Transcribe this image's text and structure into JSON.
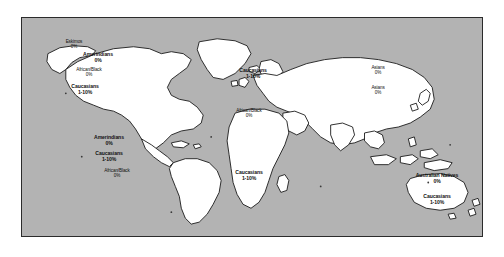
{
  "figure": {
    "type": "world-map",
    "background_color": "#ffffff",
    "ocean_color": "#b3b3b3",
    "land_color": "#ffffff",
    "outline_color": "#1a1a1a",
    "frame_color": "#2b2b2b",
    "text_color": "#111111"
  },
  "regions": [
    {
      "id": "north-america-eskimos",
      "group": "Eskimos",
      "value": "0%",
      "continent": "North America",
      "style": "small"
    },
    {
      "id": "north-america-amerindians",
      "group": "Amerindians",
      "value": "0%",
      "continent": "North America",
      "style": "bold"
    },
    {
      "id": "north-america-african-black",
      "group": "African/Black",
      "value": "0%",
      "continent": "North America",
      "style": "small"
    },
    {
      "id": "north-america-caucasians",
      "group": "Caucasians",
      "value": "1-10%",
      "continent": "North America",
      "style": "bold"
    },
    {
      "id": "south-america-amerindians",
      "group": "Amerindians",
      "value": "0%",
      "continent": "South America",
      "style": "bold"
    },
    {
      "id": "south-america-caucasians",
      "group": "Caucasians",
      "value": "1-10%",
      "continent": "South America",
      "style": "bold"
    },
    {
      "id": "south-america-african-black",
      "group": "African/Black",
      "value": "0%",
      "continent": "South America",
      "style": "small"
    },
    {
      "id": "europe-caucasians",
      "group": "Caucasians",
      "value": "1-10%",
      "continent": "Europe",
      "style": "bold"
    },
    {
      "id": "africa-african-black",
      "group": "African/Black",
      "value": "0%",
      "continent": "Africa",
      "style": "small"
    },
    {
      "id": "southern-africa-caucasians",
      "group": "Caucasians",
      "value": "1-10%",
      "continent": "Southern Africa",
      "style": "bold"
    },
    {
      "id": "asia-north-asians",
      "group": "Asians",
      "value": "0%",
      "continent": "Asia",
      "style": "small"
    },
    {
      "id": "asia-south-asians",
      "group": "Asians",
      "value": "0%",
      "continent": "Asia",
      "style": "small"
    },
    {
      "id": "australia-natives",
      "group": "Australian Natives",
      "value": "0%",
      "continent": "Australia",
      "style": "inline"
    },
    {
      "id": "australia-caucasians",
      "group": "Caucasians",
      "value": "1-10%",
      "continent": "Australia",
      "style": "bold"
    }
  ]
}
